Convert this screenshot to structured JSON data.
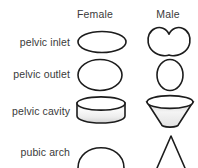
{
  "figure": {
    "title": "",
    "background_color": "#ffffff",
    "outline_color": "#1c1c1c",
    "text_color": "#3a3a3a",
    "columns": [
      {
        "id": "female",
        "label": "Female"
      },
      {
        "id": "male",
        "label": "Male"
      }
    ],
    "rows": [
      {
        "id": "pelvic-inlet",
        "label": "pelvic inlet",
        "female_shape": "wide-flat-ellipse",
        "male_shape": "heart-shaped-cardiform"
      },
      {
        "id": "pelvic-outlet",
        "label": "pelvic outlet",
        "female_shape": "large-circle",
        "male_shape": "narrow-tall-oval"
      },
      {
        "id": "pelvic-cavity",
        "label": "pelvic cavity",
        "female_shape": "shallow-wide-cylinder",
        "male_shape": "tapered-funnel-cone"
      },
      {
        "id": "pubic-arch",
        "label": "pubic arch",
        "female_shape": "wide-rounded-arch",
        "male_shape": "narrow-v-angle"
      }
    ]
  }
}
